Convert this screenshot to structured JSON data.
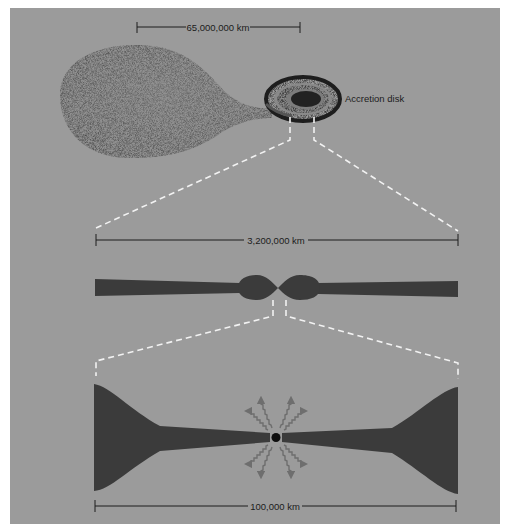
{
  "figure": {
    "background_color": "#ffffff",
    "panel_color": "#9b9b9b",
    "shape_color": "#3b3b3b",
    "dash_color": "#f2f2f2"
  },
  "top_view": {
    "scale_label": "65,000,000 km",
    "disk_label": "Accretion disk",
    "companion_star": "teardrop-star",
    "disk": "spiral-accretion-disk"
  },
  "middle_view": {
    "scale_label": "3,200,000 km",
    "shape": "edge-on-disk-with-central-bulge"
  },
  "bottom_view": {
    "scale_label": "100,000 km",
    "shape": "flared-inner-disk",
    "center": "compact-object",
    "radiation_arrows": 8
  }
}
